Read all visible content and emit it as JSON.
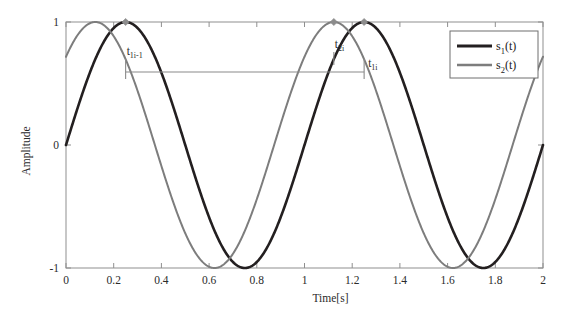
{
  "chart_data": {
    "type": "line",
    "title": "",
    "xlabel": "Time[s]",
    "ylabel": "Amplitude",
    "xlim": [
      0,
      2
    ],
    "ylim": [
      -1,
      1
    ],
    "grid": false,
    "x_ticks": [
      "0",
      "0.2",
      "0.4",
      "0.6",
      "0.8",
      "1",
      "1.2",
      "1.4",
      "1.6",
      "1.8",
      "2"
    ],
    "x_tick_values": [
      0,
      0.2,
      0.4,
      0.6,
      0.8,
      1,
      1.2,
      1.4,
      1.6,
      1.8,
      2
    ],
    "y_ticks": [
      "1",
      "0",
      "-1"
    ],
    "y_tick_values": [
      1,
      0,
      -1
    ],
    "legend_position": "top-right",
    "series": [
      {
        "name": "s_1(t)",
        "label_base": "s",
        "label_sub": "1",
        "label_arg": "(t)",
        "color": "#231f20",
        "form": "sin(2*pi*t)",
        "amplitude": 1,
        "frequency_hz": 1,
        "phase_rad": 0,
        "peaks_t": [
          0.25,
          1.25
        ],
        "troughs_t": [
          0.75,
          1.75
        ],
        "value_at_t0": 0,
        "value_at_t2": 0
      },
      {
        "name": "s_2(t)",
        "label_base": "s",
        "label_sub": "2",
        "label_arg": "(t)",
        "color": "#7d7d7d",
        "form": "sin(2*pi*t + 0.8)",
        "amplitude": 1,
        "frequency_hz": 1,
        "phase_rad": 0.8,
        "peaks_t": [
          0.123,
          1.123
        ],
        "troughs_t": [
          0.623,
          1.623
        ],
        "value_at_t0": 0.717,
        "value_at_t2": 0.717
      }
    ],
    "markers": [
      {
        "t": 0.25,
        "amplitude": 1.0,
        "shape": "diamond",
        "color": "#8c8c8c"
      },
      {
        "t": 1.123,
        "amplitude": 1.0,
        "shape": "diamond",
        "color": "#8c8c8c"
      },
      {
        "t": 1.25,
        "amplitude": 1.0,
        "shape": "diamond",
        "color": "#8c8c8c"
      }
    ],
    "annotations": [
      {
        "id": "t1i-1",
        "base": "t",
        "sub": "1i-1",
        "t": 0.25,
        "kind": "bracket-start"
      },
      {
        "id": "t2i",
        "base": "t",
        "sub": "2i",
        "t": 1.123,
        "kind": "tick"
      },
      {
        "id": "t1i",
        "base": "t",
        "sub": "1i",
        "t": 1.25,
        "kind": "bracket-end"
      }
    ],
    "interval_bracket": {
      "from_t": 0.25,
      "to_t": 1.25,
      "color": "#8a8a8a"
    }
  },
  "legend": {
    "entries": [
      {
        "base": "s",
        "sub": "1",
        "arg": "(t)",
        "color": "#231f20"
      },
      {
        "base": "s",
        "sub": "2",
        "arg": "(t)",
        "color": "#7d7d7d"
      }
    ]
  },
  "axes": {
    "x_title": "Time[s]",
    "y_title": "Amplitude"
  }
}
